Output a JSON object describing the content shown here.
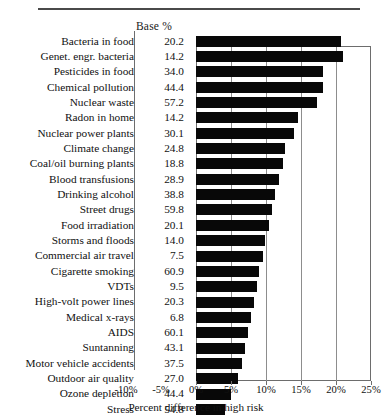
{
  "table": {
    "base_header": "Base %"
  },
  "axis": {
    "x_title": "Percent difference in high risk",
    "x_ticks": [
      "-10%",
      "-5%",
      "0%",
      "5%",
      "10%",
      "15%",
      "20%",
      "25%"
    ]
  },
  "chart_data": {
    "type": "bar",
    "orientation": "horizontal",
    "title": "",
    "xlabel": "Percent difference in high risk",
    "ylabel": "",
    "xlim": [
      -10,
      25
    ],
    "xticks": [
      -10,
      -5,
      0,
      5,
      10,
      15,
      20,
      25
    ],
    "grid": true,
    "legend": false,
    "categories": [
      "Bacteria in food",
      "Genet. engr. bacteria",
      "Pesticides in food",
      "Chemical pollution",
      "Nuclear waste",
      "Radon in home",
      "Nuclear power plants",
      "Climate change",
      "Coal/oil burning plants",
      "Blood transfusions",
      "Drinking alcohol",
      "Street drugs",
      "Food irradiation",
      "Storms and floods",
      "Commercial air travel",
      "Cigarette smoking",
      "VDTs",
      "High-volt power lines",
      "Medical x-rays",
      "AIDS",
      "Suntanning",
      "Motor vehicle accidents",
      "Outdoor air quality",
      "Ozone depletion",
      "Stress"
    ],
    "series": [
      {
        "name": "Base %",
        "values": [
          20.2,
          14.2,
          34.0,
          44.4,
          57.2,
          14.2,
          30.1,
          24.8,
          18.8,
          28.9,
          38.8,
          59.8,
          20.1,
          14.0,
          7.5,
          60.9,
          9.5,
          20.3,
          6.8,
          60.1,
          43.1,
          37.5,
          27.0,
          44.4,
          54.8
        ]
      },
      {
        "name": "Percent difference in high risk",
        "values": [
          20.7,
          21.0,
          18.1,
          18.1,
          17.3,
          14.6,
          14.0,
          12.7,
          12.4,
          11.9,
          11.3,
          10.9,
          10.4,
          9.9,
          9.6,
          9.0,
          8.7,
          8.3,
          7.9,
          7.4,
          7.0,
          6.6,
          6.0,
          5.0,
          4.2
        ]
      }
    ],
    "rows": [
      {
        "label": "Bacteria in food",
        "base": "20.2",
        "diff": 20.7
      },
      {
        "label": "Genet. engr. bacteria",
        "base": "14.2",
        "diff": 21.0
      },
      {
        "label": "Pesticides in food",
        "base": "34.0",
        "diff": 18.1
      },
      {
        "label": "Chemical pollution",
        "base": "44.4",
        "diff": 18.1
      },
      {
        "label": "Nuclear waste",
        "base": "57.2",
        "diff": 17.3
      },
      {
        "label": "Radon in home",
        "base": "14.2",
        "diff": 14.6
      },
      {
        "label": "Nuclear power plants",
        "base": "30.1",
        "diff": 14.0
      },
      {
        "label": "Climate change",
        "base": "24.8",
        "diff": 12.7
      },
      {
        "label": "Coal/oil burning plants",
        "base": "18.8",
        "diff": 12.4
      },
      {
        "label": "Blood transfusions",
        "base": "28.9",
        "diff": 11.9
      },
      {
        "label": "Drinking alcohol",
        "base": "38.8",
        "diff": 11.3
      },
      {
        "label": "Street drugs",
        "base": "59.8",
        "diff": 10.9
      },
      {
        "label": "Food irradiation",
        "base": "20.1",
        "diff": 10.4
      },
      {
        "label": "Storms and floods",
        "base": "14.0",
        "diff": 9.9
      },
      {
        "label": "Commercial air travel",
        "base": "7.5",
        "diff": 9.6
      },
      {
        "label": "Cigarette smoking",
        "base": "60.9",
        "diff": 9.0
      },
      {
        "label": "VDTs",
        "base": "9.5",
        "diff": 8.7
      },
      {
        "label": "High-volt power lines",
        "base": "20.3",
        "diff": 8.3
      },
      {
        "label": "Medical x-rays",
        "base": "6.8",
        "diff": 7.9
      },
      {
        "label": "AIDS",
        "base": "60.1",
        "diff": 7.4
      },
      {
        "label": "Suntanning",
        "base": "43.1",
        "diff": 7.0
      },
      {
        "label": "Motor vehicle accidents",
        "base": "37.5",
        "diff": 6.6
      },
      {
        "label": "Outdoor air quality",
        "base": "27.0",
        "diff": 6.0
      },
      {
        "label": "Ozone depletion",
        "base": "44.4",
        "diff": 5.0
      },
      {
        "label": "Stress",
        "base": "54.8",
        "diff": 4.2
      }
    ]
  }
}
